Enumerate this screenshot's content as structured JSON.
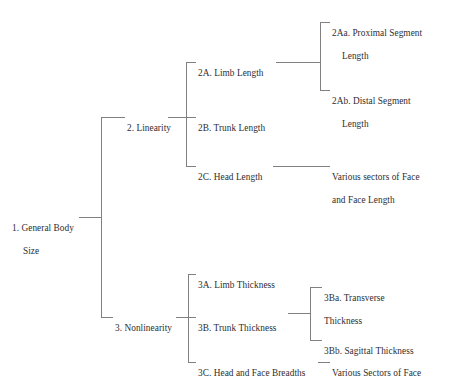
{
  "diagram": {
    "type": "tree",
    "orientation": "left-to-right",
    "line_color": "#808080",
    "text_color": "#2e2e30",
    "background_color": "#ffffff",
    "nodes": {
      "root": {
        "id": "1",
        "label_line1": "1. General Body",
        "label_line2": "Size",
        "label_full": "1. General Body Size"
      },
      "linearity": {
        "id": "2",
        "label": "2. Linearity"
      },
      "limb_length": {
        "id": "2A",
        "label": "2A. Limb Length"
      },
      "trunk_length": {
        "id": "2B",
        "label": "2B. Trunk Length"
      },
      "head_length": {
        "id": "2C",
        "label": "2C. Head Length"
      },
      "proximal_segment": {
        "id": "2Aa",
        "label_line1": "2Aa. Proximal Segment",
        "label_line2": "Length",
        "label_full": "2Aa. Proximal Segment Length"
      },
      "distal_segment": {
        "id": "2Ab",
        "label_line1": "2Ab. Distal Segment",
        "label_line2": "Length",
        "label_full": "2Ab. Distal Segment Length"
      },
      "face_sectors_length": {
        "id": "2C-leaf",
        "label_line1": "Various sectors of Face",
        "label_line2": "and Face Length",
        "label_full": "Various sectors of Face and Face Length"
      },
      "nonlinearity": {
        "id": "3",
        "label": "3. Nonlinearity"
      },
      "limb_thickness": {
        "id": "3A",
        "label": "3A. Limb Thickness"
      },
      "trunk_thickness": {
        "id": "3B",
        "label": "3B. Trunk Thickness"
      },
      "head_face_breadths": {
        "id": "3C",
        "label": "3C. Head and Face Breadths"
      },
      "transverse_thickness": {
        "id": "3Ba",
        "label_line1": "3Ba. Transverse",
        "label_line2": "Thickness",
        "label_full": "3Ba. Transverse Thickness"
      },
      "sagittal_thickness": {
        "id": "3Bb",
        "label": "3Bb. Sagittal Thickness"
      },
      "face_sectors": {
        "id": "3C-leaf",
        "label": "Various Sectors of Face"
      }
    }
  }
}
